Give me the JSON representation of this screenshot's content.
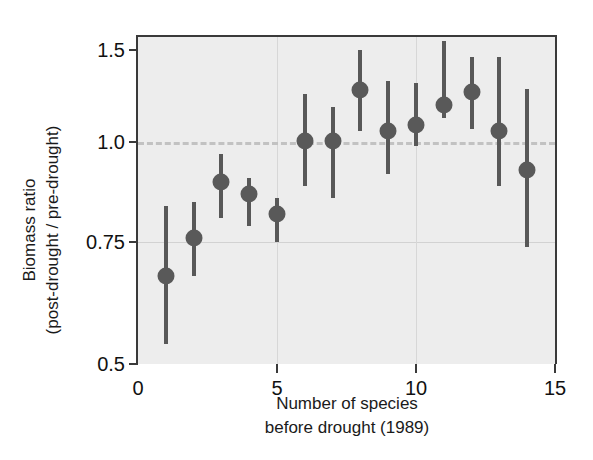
{
  "chart_data": {
    "type": "scatter",
    "title": "",
    "xlabel": "Number of species\nbefore drought (1989)",
    "xlabel_lines": [
      "Number of species",
      "before drought (1989)"
    ],
    "ylabel": "Biomass ratio\n(post-drought / pre-drought)",
    "ylabel_lines": [
      "Biomass ratio",
      "(post-drought / pre-drought)"
    ],
    "xlim": [
      0,
      15
    ],
    "ylim": [
      0.5,
      1.55
    ],
    "xticks": [
      0,
      5,
      10,
      15
    ],
    "xticklabels": [
      "0",
      "5",
      "10",
      "15"
    ],
    "yticks": [
      0.5,
      0.75,
      1.0,
      1.5
    ],
    "yticklabels": [
      "0.5",
      "0.75",
      "1.0",
      "1.5"
    ],
    "grid": true,
    "grid_axis": "both",
    "legend": false,
    "reference_line": {
      "orientation": "horizontal",
      "value": 1.0,
      "style": "dashed",
      "color": "#c2c2c2"
    },
    "marker": "circle",
    "marker_color": "#595959",
    "errorbar_color": "#585858",
    "plot_background": "#ededed",
    "x": [
      1,
      2,
      3,
      4,
      5,
      6,
      7,
      8,
      9,
      10,
      11,
      12,
      13,
      14
    ],
    "y": [
      0.68,
      0.76,
      0.9,
      0.87,
      0.82,
      1.005,
      1.005,
      1.28,
      1.06,
      1.09,
      1.2,
      1.27,
      1.06,
      0.93
    ],
    "y_low": [
      0.54,
      0.68,
      0.81,
      0.79,
      0.75,
      0.89,
      0.86,
      1.06,
      0.92,
      0.99,
      1.13,
      1.07,
      0.89,
      0.74
    ],
    "y_high": [
      0.84,
      0.85,
      0.97,
      0.91,
      0.86,
      1.26,
      1.19,
      1.5,
      1.33,
      1.32,
      1.55,
      1.46,
      1.46,
      1.29
    ],
    "points": [
      {
        "x": 1,
        "y": 0.68,
        "low": 0.54,
        "high": 0.84
      },
      {
        "x": 2,
        "y": 0.76,
        "low": 0.68,
        "high": 0.85
      },
      {
        "x": 3,
        "y": 0.9,
        "low": 0.81,
        "high": 0.97
      },
      {
        "x": 4,
        "y": 0.87,
        "low": 0.79,
        "high": 0.91
      },
      {
        "x": 5,
        "y": 0.82,
        "low": 0.75,
        "high": 0.86
      },
      {
        "x": 6,
        "y": 1.005,
        "low": 0.89,
        "high": 1.26
      },
      {
        "x": 7,
        "y": 1.005,
        "low": 0.86,
        "high": 1.19
      },
      {
        "x": 8,
        "y": 1.28,
        "low": 1.06,
        "high": 1.5
      },
      {
        "x": 9,
        "y": 1.06,
        "low": 0.92,
        "high": 1.33
      },
      {
        "x": 10,
        "y": 1.09,
        "low": 0.99,
        "high": 1.32
      },
      {
        "x": 11,
        "y": 1.2,
        "low": 1.13,
        "high": 1.55
      },
      {
        "x": 12,
        "y": 1.27,
        "low": 1.07,
        "high": 1.46
      },
      {
        "x": 13,
        "y": 1.06,
        "low": 0.89,
        "high": 1.46
      },
      {
        "x": 14,
        "y": 0.93,
        "low": 0.74,
        "high": 1.29
      }
    ]
  }
}
